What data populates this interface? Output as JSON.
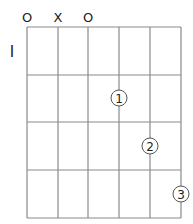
{
  "chord_diagram": {
    "fret_label": "I",
    "string_markers": [
      "O",
      "X",
      "O",
      "",
      "",
      ""
    ],
    "strings": 6,
    "frets": 4,
    "fingers": [
      {
        "string": 4,
        "fret": 2,
        "label": "1"
      },
      {
        "string": 5,
        "fret": 3,
        "label": "2"
      },
      {
        "string": 6,
        "fret": 4,
        "label": "3"
      }
    ],
    "colors": {
      "grid": "#8a8a8a",
      "text": "#222222"
    }
  }
}
